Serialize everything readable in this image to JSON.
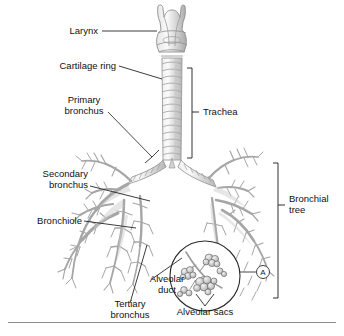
{
  "figure": {
    "background_color": "#ffffff",
    "line_color": "#9a9a9a",
    "label_color": "#111111",
    "leader_color": "#1a1a1a"
  },
  "labels": {
    "larynx": "Larynx",
    "cartilage_ring": "Cartilage ring",
    "primary_bronchus": "Primary\nbronchus",
    "secondary_bronchus": "Secondary\nbronchus",
    "bronchiole": "Bronchiole",
    "tertiary_bronchus": "Tertiary\nbronchus",
    "trachea": "Trachea",
    "bronchial_tree": "Bronchial\ntree",
    "alveolar_duct": "Alveolar\nduct",
    "alveolar_sacs": "Alveolar sacs",
    "inset_marker": "A"
  },
  "brackets": [
    {
      "name": "trachea",
      "label": "Trachea"
    },
    {
      "name": "bronchial-tree",
      "label": "Bronchial tree"
    }
  ],
  "icons": {
    "larynx": "larynx-icon",
    "trachea": "trachea-icon",
    "bronchial_tree_left": "bronchial-tree-left-icon",
    "bronchial_tree_right": "bronchial-tree-right-icon",
    "alveoli_inset": "alveoli-inset-icon"
  }
}
